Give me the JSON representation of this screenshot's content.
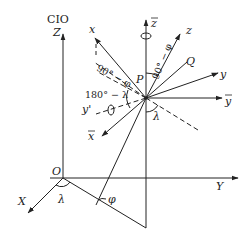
{
  "diagram": {
    "labels": {
      "cio": "CIO",
      "Z": "Z",
      "X": "X",
      "Y": "Y",
      "O": "O",
      "lambda_base": "λ",
      "phi_base": "φ",
      "x": "x",
      "y": "y",
      "z": "z",
      "x_bar": "x",
      "y_bar": "y",
      "z_bar": "z",
      "y_prime": "y'",
      "P": "P",
      "Q": "Q",
      "angle_90_minus_phi_left": "90° − φ",
      "angle_90_minus_phi_top": "90° − φ",
      "angle_180_minus_lambda": "180° − λ",
      "lambda_center": "λ"
    },
    "colors": {
      "line": "#222222",
      "background": "#ffffff"
    }
  }
}
